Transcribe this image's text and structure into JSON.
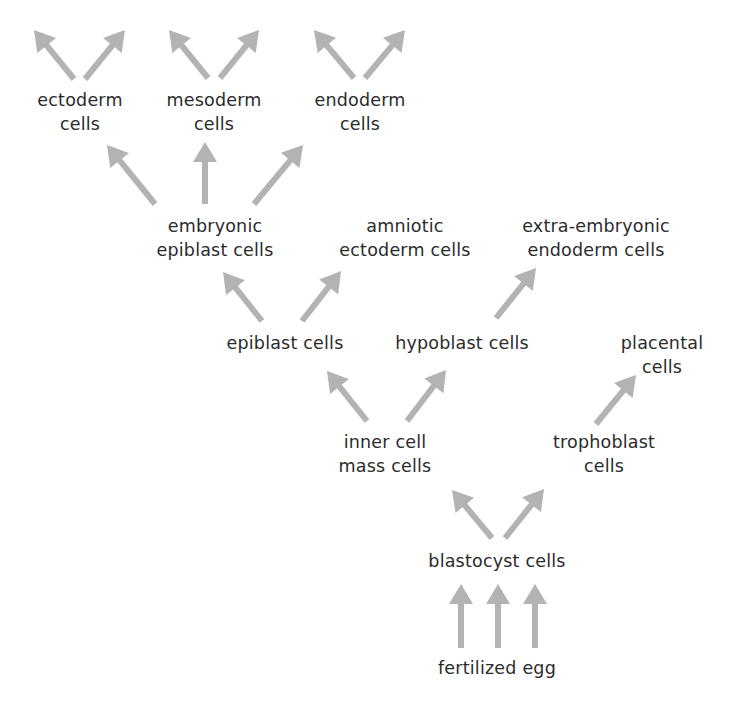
{
  "diagram": {
    "type": "cell-lineage-tree",
    "arrow_color": "#b3b3b3",
    "text_color": "#2b2b2b",
    "nodes": [
      {
        "id": "ectoderm",
        "lines": [
          "ectoderm",
          "cells"
        ],
        "x": 80,
        "y": 88
      },
      {
        "id": "mesoderm",
        "lines": [
          "mesoderm",
          "cells"
        ],
        "x": 214,
        "y": 88
      },
      {
        "id": "endoderm",
        "lines": [
          "endoderm",
          "cells"
        ],
        "x": 360,
        "y": 88
      },
      {
        "id": "embryonic_epiblast",
        "lines": [
          "embryonic",
          "epiblast cells"
        ],
        "x": 215,
        "y": 214
      },
      {
        "id": "amniotic_ectoderm",
        "lines": [
          "amniotic",
          "ectoderm cells"
        ],
        "x": 405,
        "y": 214
      },
      {
        "id": "extra_embryonic_endoderm",
        "lines": [
          "extra-embryonic",
          "endoderm cells"
        ],
        "x": 596,
        "y": 214
      },
      {
        "id": "epiblast",
        "lines": [
          "epiblast cells"
        ],
        "x": 285,
        "y": 331
      },
      {
        "id": "hypoblast",
        "lines": [
          "hypoblast cells"
        ],
        "x": 462,
        "y": 331
      },
      {
        "id": "placental",
        "lines": [
          "placental",
          "cells"
        ],
        "x": 662,
        "y": 331
      },
      {
        "id": "inner_cell_mass",
        "lines": [
          "inner cell",
          "mass cells"
        ],
        "x": 385,
        "y": 430
      },
      {
        "id": "trophoblast",
        "lines": [
          "trophoblast",
          "cells"
        ],
        "x": 604,
        "y": 430
      },
      {
        "id": "blastocyst",
        "lines": [
          "blastocyst cells"
        ],
        "x": 497,
        "y": 549
      },
      {
        "id": "fertilized_egg",
        "lines": [
          "fertilized egg"
        ],
        "x": 497,
        "y": 656
      }
    ],
    "arrows": [
      {
        "from": "ectoderm",
        "to": "(off-image)",
        "x1": 74,
        "y1": 79,
        "x2": 34,
        "y2": 30
      },
      {
        "from": "ectoderm",
        "to": "(off-image)",
        "x1": 85,
        "y1": 79,
        "x2": 125,
        "y2": 30
      },
      {
        "from": "mesoderm",
        "to": "(off-image)",
        "x1": 208,
        "y1": 78,
        "x2": 169,
        "y2": 30
      },
      {
        "from": "mesoderm",
        "to": "(off-image)",
        "x1": 220,
        "y1": 78,
        "x2": 259,
        "y2": 30
      },
      {
        "from": "endoderm",
        "to": "(off-image)",
        "x1": 354,
        "y1": 78,
        "x2": 314,
        "y2": 30
      },
      {
        "from": "endoderm",
        "to": "(off-image)",
        "x1": 365,
        "y1": 78,
        "x2": 405,
        "y2": 30
      },
      {
        "from": "embryonic_epiblast",
        "to": "ectoderm",
        "x1": 155,
        "y1": 204,
        "x2": 107,
        "y2": 145
      },
      {
        "from": "embryonic_epiblast",
        "to": "mesoderm",
        "x1": 205,
        "y1": 204,
        "x2": 205,
        "y2": 142
      },
      {
        "from": "embryonic_epiblast",
        "to": "endoderm",
        "x1": 254,
        "y1": 204,
        "x2": 303,
        "y2": 145
      },
      {
        "from": "epiblast",
        "to": "embryonic_epiblast",
        "x1": 262,
        "y1": 321,
        "x2": 223,
        "y2": 272
      },
      {
        "from": "epiblast",
        "to": "amniotic_ectoderm",
        "x1": 302,
        "y1": 321,
        "x2": 341,
        "y2": 271
      },
      {
        "from": "hypoblast",
        "to": "extra_embryonic_endoderm",
        "x1": 496,
        "y1": 318,
        "x2": 536,
        "y2": 268
      },
      {
        "from": "inner_cell_mass",
        "to": "epiblast",
        "x1": 367,
        "y1": 421,
        "x2": 327,
        "y2": 371
      },
      {
        "from": "inner_cell_mass",
        "to": "hypoblast",
        "x1": 407,
        "y1": 421,
        "x2": 446,
        "y2": 370
      },
      {
        "from": "trophoblast",
        "to": "placental",
        "x1": 596,
        "y1": 424,
        "x2": 636,
        "y2": 375
      },
      {
        "from": "blastocyst",
        "to": "inner_cell_mass",
        "x1": 492,
        "y1": 538,
        "x2": 452,
        "y2": 490
      },
      {
        "from": "blastocyst",
        "to": "trophoblast",
        "x1": 505,
        "y1": 538,
        "x2": 544,
        "y2": 489
      },
      {
        "from": "fertilized_egg",
        "to": "blastocyst",
        "x1": 461,
        "y1": 648,
        "x2": 461,
        "y2": 584
      },
      {
        "from": "fertilized_egg",
        "to": "blastocyst",
        "x1": 498,
        "y1": 648,
        "x2": 498,
        "y2": 584
      },
      {
        "from": "fertilized_egg",
        "to": "blastocyst",
        "x1": 535,
        "y1": 648,
        "x2": 535,
        "y2": 584
      }
    ]
  }
}
